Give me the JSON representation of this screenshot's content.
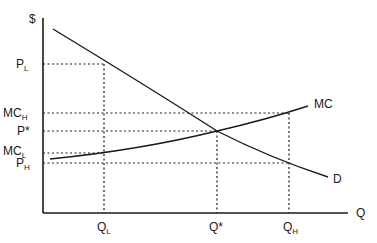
{
  "diagram": {
    "axes": {
      "y_label": "$",
      "x_label": "Q"
    },
    "curves": [
      {
        "id": "D",
        "label": "D",
        "from": [
          53,
          29
        ],
        "to": [
          328,
          177
        ]
      },
      {
        "id": "MC",
        "label": "MC",
        "from": [
          50,
          159
        ],
        "to": [
          308,
          106
        ]
      }
    ],
    "y_ticks": [
      {
        "main": "P",
        "sub": "L",
        "y": 64
      },
      {
        "main": "MC",
        "sub": "H",
        "y": 113
      },
      {
        "main": "P*",
        "sub": "",
        "y": 131
      },
      {
        "main": "MC",
        "sub": "L",
        "y": 153
      },
      {
        "main": "P",
        "sub": "H",
        "y": 163
      }
    ],
    "x_ticks": [
      {
        "main": "Q",
        "sub": "L",
        "x": 104
      },
      {
        "main": "Q*",
        "sub": "",
        "x": 217
      },
      {
        "main": "Q",
        "sub": "H",
        "x": 289
      }
    ],
    "labels": {
      "dollar": "$",
      "q_axis": "Q",
      "mc_curve": "MC",
      "d_curve": "D",
      "pl_main": "P",
      "pl_sub": "L",
      "mch_main": "MC",
      "mch_sub": "H",
      "pstar": "P*",
      "mcl_main": "MC",
      "mcl_sub": "L",
      "ph_main": "P",
      "ph_sub": "H",
      "ql_main": "Q",
      "ql_sub": "L",
      "qstar": "Q*",
      "qh_main": "Q",
      "qh_sub": "H"
    },
    "colors": {
      "line": "#1a1a1a",
      "background": "#ffffff"
    }
  }
}
